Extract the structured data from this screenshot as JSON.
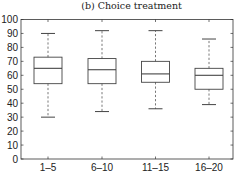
{
  "chart_data": {
    "type": "box",
    "title": "(b) Choice treatment",
    "xlabel": "",
    "ylabel": "",
    "ylim": [
      0,
      100
    ],
    "yticks": [
      0,
      10,
      20,
      30,
      40,
      50,
      60,
      70,
      80,
      90,
      100
    ],
    "categories": [
      "1–5",
      "6–10",
      "11–15",
      "16–20"
    ],
    "boxes": [
      {
        "label": "1–5",
        "whisker_low": 30,
        "q1": 54,
        "median": 65,
        "q3": 73,
        "whisker_high": 90
      },
      {
        "label": "6–10",
        "whisker_low": 34,
        "q1": 54,
        "median": 64,
        "q3": 72,
        "whisker_high": 92
      },
      {
        "label": "11–15",
        "whisker_low": 36,
        "q1": 55,
        "median": 61,
        "q3": 70,
        "whisker_high": 92
      },
      {
        "label": "16–20",
        "whisker_low": 39,
        "q1": 50,
        "median": 60,
        "q3": 65,
        "whisker_high": 86
      }
    ],
    "grid": false,
    "legend": null
  },
  "colors": {
    "axis": "#333333",
    "box": "#444444",
    "whisker": "#555555"
  }
}
